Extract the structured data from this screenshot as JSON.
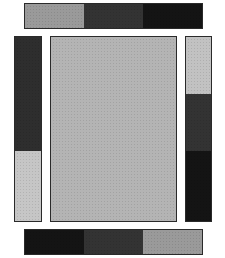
{
  "canvas": {
    "width": 225,
    "height": 258,
    "background": "#ffffff"
  },
  "panels": {
    "top_bar": {
      "x": 24,
      "y": 3,
      "w": 179,
      "h": 26,
      "orientation": "row",
      "segments": [
        {
          "color": "#9a9a9a",
          "size": 60
        },
        {
          "color": "#333333",
          "size": 59
        },
        {
          "color": "#141414",
          "size": 60
        }
      ]
    },
    "left_column": {
      "x": 14,
      "y": 36,
      "w": 28,
      "h": 186,
      "orientation": "col",
      "segments": [
        {
          "color": "#2e2e2e",
          "size": 115
        },
        {
          "color": "#c6c6c6",
          "size": 71
        }
      ]
    },
    "center_panel": {
      "x": 50,
      "y": 36,
      "w": 127,
      "h": 186,
      "orientation": "col",
      "segments": [
        {
          "color": "#b4b4b4",
          "size": 186
        }
      ]
    },
    "right_column": {
      "x": 185,
      "y": 36,
      "w": 27,
      "h": 186,
      "orientation": "col",
      "segments": [
        {
          "color": "#c2c2c2",
          "size": 58
        },
        {
          "color": "#333333",
          "size": 57
        },
        {
          "color": "#141414",
          "size": 71
        }
      ]
    },
    "bottom_bar": {
      "x": 24,
      "y": 229,
      "w": 179,
      "h": 26,
      "orientation": "row",
      "segments": [
        {
          "color": "#141414",
          "size": 60
        },
        {
          "color": "#333333",
          "size": 59
        },
        {
          "color": "#9a9a9a",
          "size": 60
        }
      ]
    }
  }
}
